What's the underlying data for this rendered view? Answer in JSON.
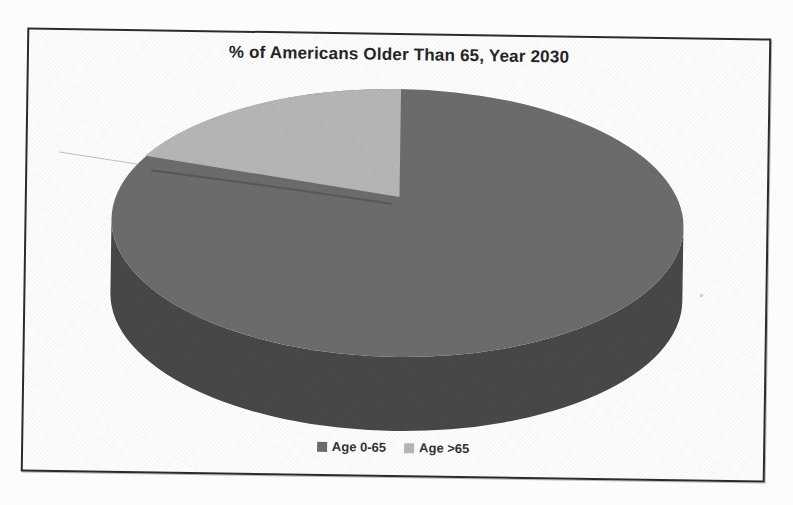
{
  "page": {
    "background_color": "#fcfcfc"
  },
  "frame": {
    "border_color": "#2b2b2b"
  },
  "chart": {
    "title": "% of Americans Older Than 65, Year 2030",
    "legend": [
      {
        "label": "Age 0-65",
        "color": "#6c6c6c"
      },
      {
        "label": "Age >65",
        "color": "#b6b6b6"
      }
    ]
  },
  "chart_data": {
    "type": "pie",
    "projection": "3d",
    "title": "% of Americans Older Than 65, Year 2030",
    "categories": [
      "Age 0-65",
      "Age >65"
    ],
    "values": [
      80,
      20
    ],
    "unit": "percent",
    "colors": [
      "#6c6c6c",
      "#b6b6b6"
    ],
    "side_color": "#484848",
    "legend_position": "bottom",
    "data_labels_shown": false,
    "start_angle_deg": 90,
    "small_slice_position": "upper-left"
  }
}
